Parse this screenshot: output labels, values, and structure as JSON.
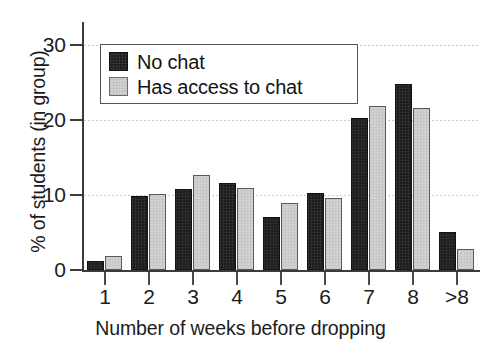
{
  "chart_data": {
    "type": "bar",
    "title": "",
    "xlabel": "Number of weeks before dropping",
    "ylabel": "% of students (in group)",
    "categories": [
      "1",
      "2",
      "3",
      "4",
      "5",
      "6",
      "7",
      "8",
      ">8"
    ],
    "series": [
      {
        "name": "No chat",
        "color": "#1d1d1d",
        "values": [
          1.2,
          9.8,
          10.8,
          11.6,
          7.0,
          10.3,
          20.2,
          24.8,
          5.0
        ]
      },
      {
        "name": "Has access to chat",
        "color": "#d2d2d2",
        "values": [
          1.8,
          10.1,
          12.7,
          10.9,
          8.9,
          9.6,
          21.8,
          21.6,
          2.8
        ]
      }
    ],
    "ylim": [
      0,
      33
    ],
    "yticks": [
      "0",
      "10",
      "20",
      "30"
    ],
    "ytick_values": [
      0,
      10,
      20,
      30
    ],
    "grid": "horizontal-dotted",
    "legend_position": "top-left"
  },
  "legend": {
    "items": [
      {
        "label": "No chat",
        "swatch": "dark-swatch"
      },
      {
        "label": "Has access to chat",
        "swatch": "light-swatch"
      }
    ]
  },
  "axes": {
    "y_title": "% of students (in group)",
    "x_title": "Number of weeks before dropping"
  }
}
